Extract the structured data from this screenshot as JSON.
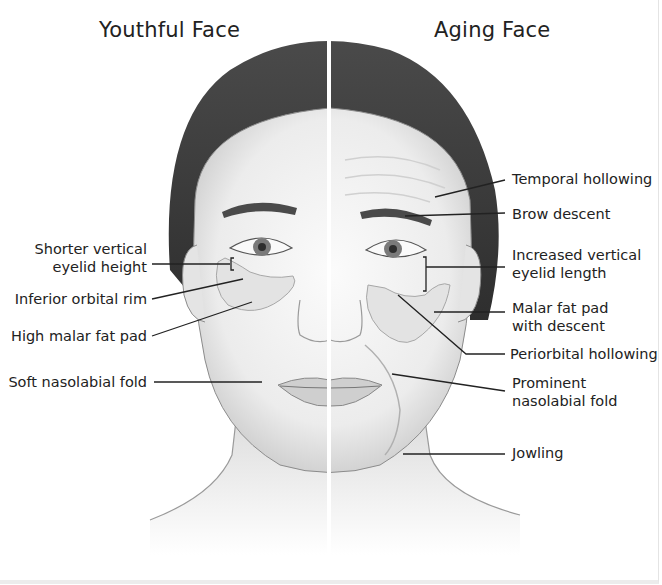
{
  "titles": {
    "left": "Youthful Face",
    "right": "Aging Face"
  },
  "left_labels": [
    {
      "line1": "Shorter vertical",
      "line2": "eyelid height"
    },
    {
      "line1": "Inferior orbital rim"
    },
    {
      "line1": "High malar fat pad"
    },
    {
      "line1": "Soft nasolabial fold"
    }
  ],
  "right_labels": [
    {
      "line1": "Temporal hollowing"
    },
    {
      "line1": "Brow descent"
    },
    {
      "line1": "Increased vertical",
      "line2": "eyelid length"
    },
    {
      "line1": "Malar fat pad",
      "line2": "with descent"
    },
    {
      "line1": "Periorbital hollowing"
    },
    {
      "line1": "Prominent",
      "line2": "nasolabial fold"
    },
    {
      "line1": "Jowling"
    }
  ],
  "colors": {
    "hair": "#3f3f3f",
    "skin": "#f2f2f2",
    "fat_pad": "#e2e2e2",
    "leader_line": "#222222",
    "divider": "#ffffff"
  }
}
